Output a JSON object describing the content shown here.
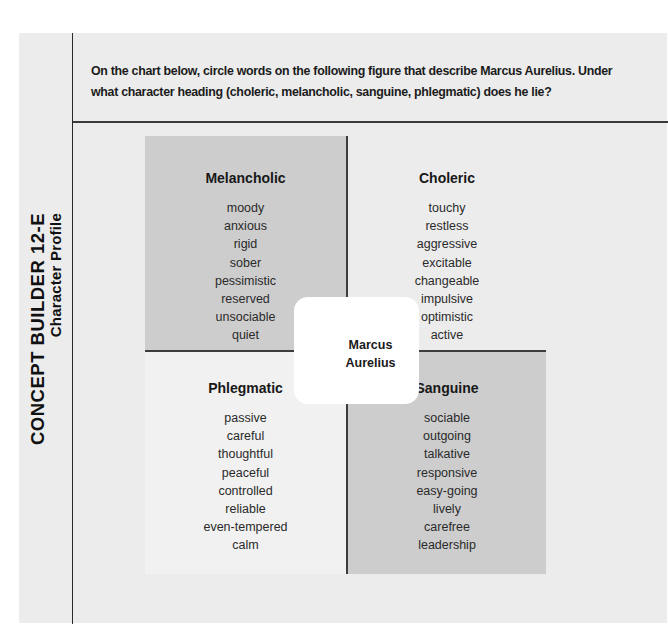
{
  "sidebar": {
    "title": "CONCEPT BUILDER 12-E",
    "subtitle": "Character Profile"
  },
  "instructions": {
    "text": "On the chart below, circle words on the following figure that describe Marcus Aurelius. Under what character heading (choleric, melancholic, sanguine, phlegmatic) does he lie?"
  },
  "chart": {
    "center_label_line1": "Marcus",
    "center_label_line2": "Aurelius",
    "quadrants": [
      {
        "position": "top-left",
        "heading": "Melancholic",
        "fill": "#cdcdcd",
        "words": [
          "moody",
          "anxious",
          "rigid",
          "sober",
          "pessimistic",
          "reserved",
          "unsociable",
          "quiet"
        ]
      },
      {
        "position": "top-right",
        "heading": "Choleric",
        "fill": "#ececec",
        "words": [
          "touchy",
          "restless",
          "aggressive",
          "excitable",
          "changeable",
          "impulsive",
          "optimistic",
          "active"
        ]
      },
      {
        "position": "bottom-left",
        "heading": "Phlegmatic",
        "fill": "#f1f1f1",
        "words": [
          "passive",
          "careful",
          "thoughtful",
          "peaceful",
          "controlled",
          "reliable",
          "even-tempered",
          "calm"
        ]
      },
      {
        "position": "bottom-right",
        "heading": "Sanguine",
        "fill": "#cdcdcd",
        "words": [
          "sociable",
          "outgoing",
          "talkative",
          "responsive",
          "easy-going",
          "lively",
          "carefree",
          "leadership"
        ]
      }
    ]
  }
}
